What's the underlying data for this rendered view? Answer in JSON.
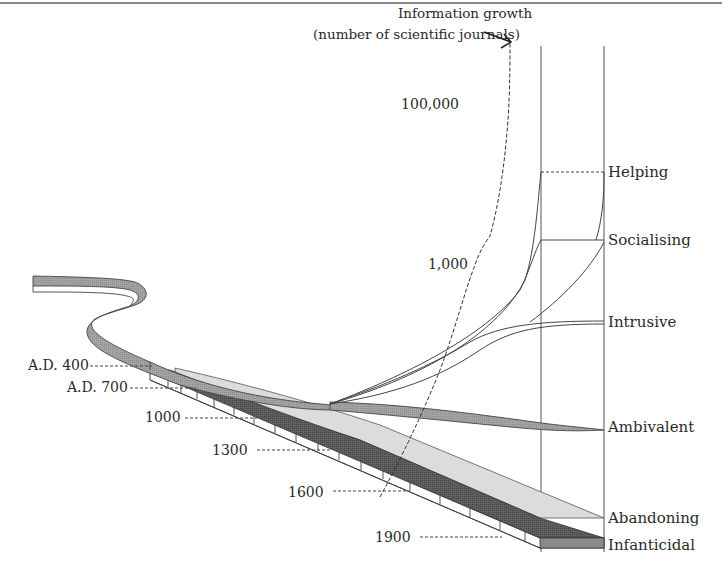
{
  "figure": {
    "title_line1": "Information growth",
    "title_line2": "(number of scientific journals)",
    "journal_scale": [
      "100,000",
      "1,000"
    ],
    "dates": [
      "A.D. 400",
      "A.D. 700",
      "1000",
      "1300",
      "1600",
      "1900"
    ],
    "modes": [
      "Helping",
      "Socialising",
      "Intrusive",
      "Ambivalent",
      "Abandoning",
      "Infanticidal"
    ],
    "colors": {
      "ribbon_medium": "#a9a9a9",
      "ribbon_light": "#d9d9d9",
      "ribbon_dark": "#5e5e5e",
      "line": "#444444",
      "frame_top": "#8a8a8a"
    }
  }
}
